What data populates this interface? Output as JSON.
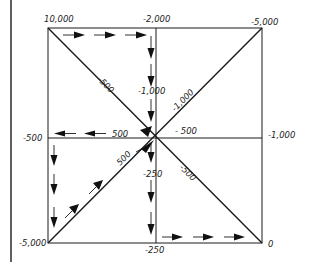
{
  "diagram": {
    "colors": {
      "line": "#1a1a1a",
      "background": "#ffffff"
    },
    "nodes": {
      "top_left": "10,000",
      "top_center": "-2,000",
      "top_right": "-5,000",
      "mid_left": "-500",
      "mid_right": "-1,000",
      "bottom_left": "-5,000",
      "bottom_center": "-250",
      "bottom_right": "0"
    },
    "edges": {
      "diag_top_left": "-500",
      "diag_top_right": "-1,000",
      "vertical_upper": "-1,000",
      "horizontal_left": "500",
      "horizontal_right": "- 500",
      "diag_bottom_left": "500",
      "vertical_lower": "-250",
      "diag_bottom_right": "-500"
    },
    "path_arrows": [
      "top edge: left to right",
      "center vertical upper: downward",
      "diagonal into center from top-left",
      "middle horizontal left: leftward",
      "left edge lower: downward",
      "diagonal bottom-left: up-right toward center",
      "center vertical lower: downward",
      "bottom edge right: left to right"
    ]
  }
}
